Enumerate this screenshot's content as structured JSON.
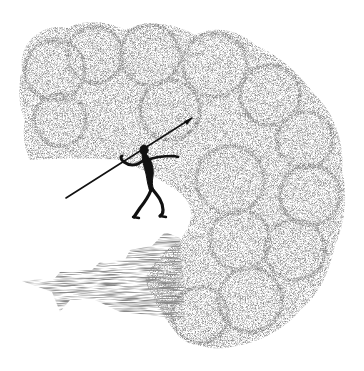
{
  "illustration": {
    "subject": "stippled drawing of a spear-throwing figure on a cliff edge beneath a billowing cloud mass",
    "colors": {
      "background": "#ffffff",
      "stipple": "#3a3a3a",
      "figure": "#111111"
    },
    "elements": [
      {
        "name": "cloud-mass",
        "description": "large stippled billowing cloud curling around"
      },
      {
        "name": "cliff",
        "description": "hatched cliff face at lower left"
      },
      {
        "name": "figure",
        "description": "black silhouette human figure holding a spear"
      },
      {
        "name": "spear",
        "description": "long thin spear angled up-right"
      }
    ]
  }
}
